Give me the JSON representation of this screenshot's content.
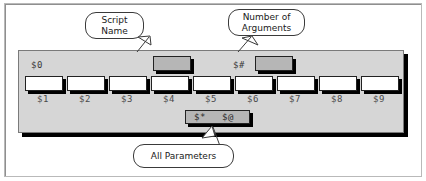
{
  "diagram": {
    "callouts": [
      {
        "id": "script-name",
        "lines": [
          "Script",
          "Name"
        ]
      },
      {
        "id": "number-arguments",
        "lines": [
          "Number of",
          "Arguments"
        ]
      },
      {
        "id": "all-parameters",
        "lines": [
          "All Parameters"
        ]
      }
    ],
    "top_row": [
      {
        "id": "script-name-slot",
        "label": "$0",
        "box_fill": "#b6b6b6"
      },
      {
        "id": "argument-count-slot",
        "label": "$#",
        "box_fill": "#b6b6b6"
      }
    ],
    "parameter_slots": [
      {
        "label": "$1",
        "box_fill": "#ffffff"
      },
      {
        "label": "$2",
        "box_fill": "#ffffff"
      },
      {
        "label": "$3",
        "box_fill": "#ffffff"
      },
      {
        "label": "$4",
        "box_fill": "#ffffff"
      },
      {
        "label": "$5",
        "box_fill": "#ffffff"
      },
      {
        "label": "$6",
        "box_fill": "#ffffff"
      },
      {
        "label": "$7",
        "box_fill": "#ffffff"
      },
      {
        "label": "$8",
        "box_fill": "#ffffff"
      },
      {
        "label": "$9",
        "box_fill": "#ffffff"
      }
    ],
    "all_parameters_bar": {
      "symbol_star": "$*",
      "symbol_at": "$@",
      "fill": "#b6b6b6"
    },
    "colors": {
      "panel": "#d6d6d6",
      "box_gray": "#b6b6b6",
      "box_white": "#ffffff",
      "shadow": "#000000",
      "outline": "#222222",
      "label_text": "#4a4a4a",
      "callout_text": "#1a1a1a",
      "canvas": "#ffffff",
      "frame_border": "#b9b9b9"
    }
  }
}
